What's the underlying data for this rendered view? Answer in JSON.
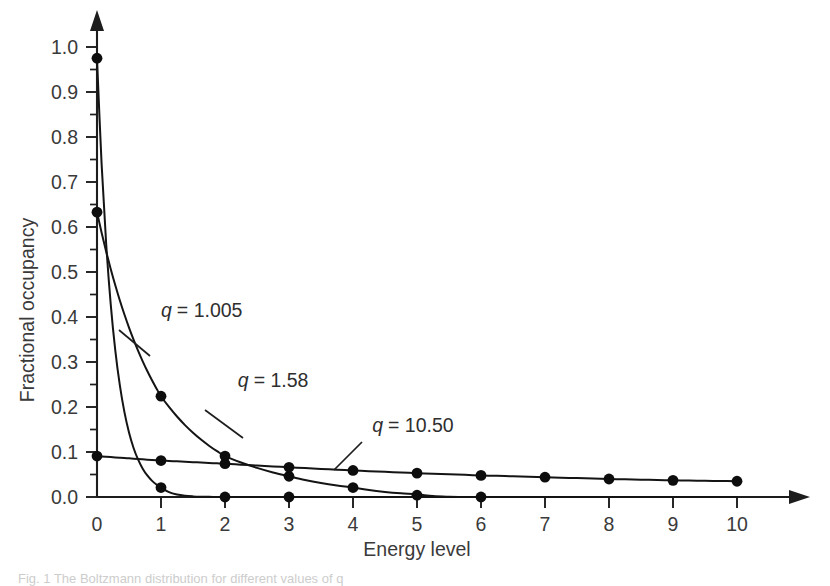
{
  "figure": {
    "caption": "Fig. 1   The Boltzmann distribution for different values of q"
  },
  "chart_data": {
    "type": "line",
    "title": "",
    "xlabel": "Energy level",
    "ylabel": "Fractional occupancy",
    "xlim": [
      0,
      10
    ],
    "ylim": [
      0.0,
      1.0
    ],
    "grid": false,
    "legend_position": "inline-annotations",
    "x": [
      0,
      1,
      2,
      3,
      4,
      5,
      6,
      7,
      8,
      9,
      10
    ],
    "xticklabels": [
      "0",
      "1",
      "2",
      "3",
      "4",
      "5",
      "6",
      "7",
      "8",
      "9",
      "10"
    ],
    "yticklabels": [
      "0.0",
      "0.1",
      "0.2",
      "0.3",
      "0.4",
      "0.5",
      "0.6",
      "0.7",
      "0.8",
      "0.9",
      "1.0"
    ],
    "ytick_values": [
      0.0,
      0.1,
      0.2,
      0.3,
      0.4,
      0.5,
      0.6,
      0.7,
      0.8,
      0.9,
      1.0
    ],
    "yminor_step": 0.05,
    "series": [
      {
        "name": "q = 1.005",
        "label": "q = 1.005",
        "q_symbol": "q",
        "value_text": "= 1.005",
        "values": [
          0.975,
          0.021,
          0.0,
          0.0,
          0.0,
          0.0,
          0.0,
          0.0,
          0.0,
          0.0,
          0.0
        ],
        "marker_x": [
          0,
          1,
          2,
          3
        ],
        "marker_y": [
          0.975,
          0.021,
          0.0,
          0.0
        ]
      },
      {
        "name": "q = 1.58",
        "label": "q = 1.58",
        "q_symbol": "q",
        "value_text": "= 1.58",
        "values": [
          0.633,
          0.224,
          0.091,
          0.046,
          0.021,
          0.006,
          0.0,
          0.0,
          0.0,
          0.0,
          0.0
        ],
        "marker_x": [
          0,
          1,
          2,
          3,
          4,
          5,
          6
        ],
        "marker_y": [
          0.633,
          0.224,
          0.091,
          0.046,
          0.021,
          0.004,
          0.0
        ]
      },
      {
        "name": "q = 10.50",
        "label": "q = 10.50",
        "q_symbol": "q",
        "value_text": "= 10.50",
        "values": [
          0.091,
          0.081,
          0.074,
          0.066,
          0.059,
          0.053,
          0.048,
          0.044,
          0.04,
          0.037,
          0.035
        ],
        "marker_x": [
          0,
          1,
          2,
          3,
          4,
          5,
          6,
          7,
          8,
          9,
          10
        ],
        "marker_y": [
          0.091,
          0.081,
          0.074,
          0.066,
          0.059,
          0.053,
          0.048,
          0.044,
          0.04,
          0.037,
          0.035
        ]
      }
    ],
    "annotations": [
      {
        "text": "q = 1.005",
        "x": 1.0,
        "y": 0.4
      },
      {
        "text": "q = 1.58",
        "x": 2.2,
        "y": 0.245
      },
      {
        "text": "q = 10.50",
        "x": 4.3,
        "y": 0.145
      }
    ]
  },
  "colors": {
    "ink": "#141414",
    "axis": "#1d1d1d",
    "label": "#3a3a3a",
    "background": "#ffffff"
  }
}
